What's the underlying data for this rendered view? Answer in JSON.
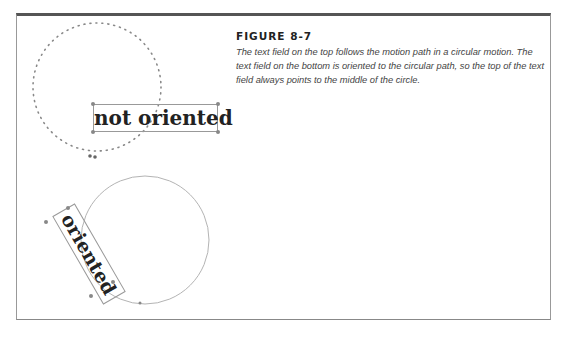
{
  "figure": {
    "title": "FIGURE 8-7",
    "caption": "The text field on the top follows the motion path in a circular motion. The text field on the bottom is oriented to the circular path, so the top of the text field always points to the middle of the circle."
  },
  "illustration": {
    "top_label": "not oriented",
    "bottom_label": "oriented"
  },
  "colors": {
    "frame_top": "#555555",
    "path": "#888888",
    "text": "#222222"
  }
}
